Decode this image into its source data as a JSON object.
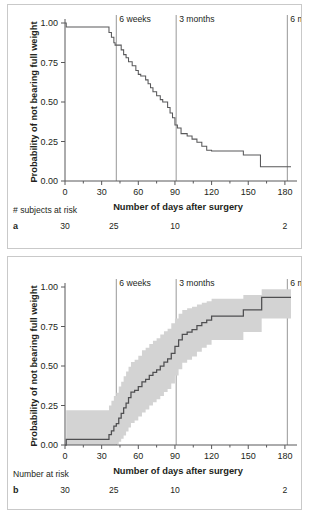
{
  "figure": {
    "panels": [
      {
        "letter": "a",
        "risk_row_title": "# subjects at risk",
        "risk_values": [
          "30",
          "25",
          "10",
          "2"
        ],
        "risk_positions": [
          0,
          40,
          90,
          180
        ]
      },
      {
        "letter": "b",
        "risk_row_title": "Number at risk",
        "risk_values": [
          "30",
          "25",
          "10",
          "2"
        ],
        "risk_positions": [
          0,
          40,
          90,
          180
        ]
      }
    ]
  },
  "chart_data": [
    {
      "type": "line",
      "id": "panel-a-km",
      "title": "",
      "xlabel": "Number of days after surgery",
      "ylabel": "Probability of not bearing full weight",
      "xlim": [
        0,
        185
      ],
      "ylim": [
        0,
        1.0
      ],
      "xticks": [
        0,
        30,
        60,
        90,
        120,
        150,
        180
      ],
      "xticklabels": [
        "0",
        "30",
        "60",
        "90",
        "120",
        "150",
        "180"
      ],
      "yticks": [
        0.0,
        0.25,
        0.5,
        0.75,
        1.0
      ],
      "yticklabels": [
        "0.00",
        "0.25",
        "0.50",
        "0.75",
        "1.00"
      ],
      "grid": false,
      "legend": "none",
      "annotations": [
        {
          "label": "6 weeks",
          "x": 42
        },
        {
          "label": "3 months",
          "x": 91
        },
        {
          "label": "6 months",
          "x": 182
        }
      ],
      "series": [
        {
          "name": "Kaplan-Meier survival (not bearing full weight)",
          "style": "step",
          "x": [
            0,
            1,
            34,
            36,
            38,
            40,
            41,
            44,
            46,
            48,
            50,
            52,
            55,
            58,
            60,
            62,
            64,
            66,
            68,
            70,
            72,
            75,
            78,
            80,
            82,
            84,
            86,
            88,
            90,
            92,
            95,
            100,
            104,
            108,
            112,
            116,
            120,
            142,
            146,
            158,
            160,
            185
          ],
          "y": [
            1.0,
            0.975,
            0.975,
            0.94,
            0.91,
            0.875,
            0.86,
            0.86,
            0.83,
            0.8,
            0.78,
            0.755,
            0.73,
            0.7,
            0.675,
            0.665,
            0.665,
            0.64,
            0.615,
            0.59,
            0.565,
            0.54,
            0.515,
            0.5,
            0.5,
            0.465,
            0.43,
            0.4,
            0.355,
            0.335,
            0.3,
            0.285,
            0.265,
            0.245,
            0.22,
            0.195,
            0.19,
            0.19,
            0.165,
            0.165,
            0.09,
            0.09
          ]
        }
      ]
    },
    {
      "type": "line",
      "id": "panel-b-km",
      "title": "",
      "xlabel": "Number of days after surgery",
      "ylabel": "Probability of not bearing full weight",
      "xlim": [
        0,
        185
      ],
      "ylim": [
        0,
        1.0
      ],
      "xticks": [
        0,
        30,
        60,
        90,
        120,
        150,
        180
      ],
      "xticklabels": [
        "0",
        "30",
        "60",
        "90",
        "120",
        "150",
        "180"
      ],
      "yticks": [
        0.0,
        0.25,
        0.5,
        0.75,
        1.0
      ],
      "yticklabels": [
        "0.00",
        "0.25",
        "0.50",
        "0.75",
        "1.00"
      ],
      "grid": false,
      "legend": "none",
      "annotations": [
        {
          "label": "6 weeks",
          "x": 42
        },
        {
          "label": "3 months",
          "x": 91
        },
        {
          "label": "6 months",
          "x": 182
        }
      ],
      "series": [
        {
          "name": "Cumulative probability of bearing full weight",
          "style": "step",
          "x": [
            0,
            1,
            34,
            36,
            38,
            40,
            42,
            44,
            46,
            48,
            50,
            52,
            54,
            57,
            60,
            63,
            66,
            69,
            72,
            75,
            78,
            81,
            84,
            87,
            90,
            93,
            96,
            100,
            104,
            108,
            112,
            116,
            120,
            142,
            146,
            158,
            161,
            185
          ],
          "y": [
            0.0,
            0.035,
            0.035,
            0.065,
            0.09,
            0.12,
            0.135,
            0.17,
            0.2,
            0.235,
            0.265,
            0.3,
            0.335,
            0.345,
            0.37,
            0.4,
            0.415,
            0.44,
            0.46,
            0.475,
            0.5,
            0.525,
            0.545,
            0.58,
            0.625,
            0.665,
            0.7,
            0.715,
            0.73,
            0.755,
            0.775,
            0.79,
            0.815,
            0.815,
            0.855,
            0.855,
            0.935,
            0.935
          ]
        },
        {
          "name": "Upper 95% confidence limit",
          "style": "band-upper",
          "x": [
            0,
            1,
            34,
            36,
            38,
            40,
            42,
            44,
            46,
            48,
            50,
            52,
            54,
            57,
            60,
            63,
            66,
            69,
            72,
            75,
            78,
            81,
            84,
            87,
            90,
            93,
            96,
            100,
            104,
            108,
            112,
            116,
            120,
            142,
            146,
            158,
            161,
            185
          ],
          "y": [
            0.0,
            0.22,
            0.22,
            0.25,
            0.28,
            0.31,
            0.33,
            0.37,
            0.4,
            0.435,
            0.465,
            0.495,
            0.525,
            0.54,
            0.565,
            0.6,
            0.615,
            0.64,
            0.66,
            0.675,
            0.7,
            0.72,
            0.735,
            0.77,
            0.8,
            0.83,
            0.855,
            0.865,
            0.875,
            0.89,
            0.9,
            0.91,
            0.925,
            0.925,
            0.95,
            0.95,
            0.985,
            0.985
          ]
        },
        {
          "name": "Lower 95% confidence limit",
          "style": "band-lower",
          "x": [
            0,
            1,
            34,
            36,
            38,
            40,
            42,
            44,
            46,
            48,
            50,
            52,
            54,
            57,
            60,
            63,
            66,
            69,
            72,
            75,
            78,
            81,
            84,
            87,
            90,
            93,
            96,
            100,
            104,
            108,
            112,
            116,
            120,
            142,
            146,
            158,
            161,
            185
          ],
          "y": [
            0.0,
            0.0,
            0.0,
            0.0,
            0.0,
            0.0,
            0.005,
            0.02,
            0.04,
            0.06,
            0.085,
            0.11,
            0.14,
            0.155,
            0.18,
            0.205,
            0.225,
            0.25,
            0.27,
            0.29,
            0.31,
            0.335,
            0.355,
            0.39,
            0.44,
            0.48,
            0.52,
            0.54,
            0.56,
            0.59,
            0.615,
            0.635,
            0.665,
            0.665,
            0.715,
            0.715,
            0.8,
            0.8
          ]
        }
      ]
    }
  ]
}
